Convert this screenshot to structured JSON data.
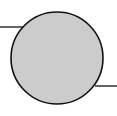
{
  "diagram": {
    "node": {
      "shape": "circle",
      "cx": 57,
      "cy": 58,
      "r": 46,
      "fill": "#cccccc",
      "stroke": "#111111"
    },
    "edges": [
      {
        "id": "left-connector",
        "x1": 0,
        "y1": 27,
        "x2": 24,
        "y2": 27,
        "stroke": "#111111"
      },
      {
        "id": "right-connector",
        "x1": 95,
        "y1": 86,
        "x2": 117,
        "y2": 86,
        "stroke": "#111111"
      }
    ]
  }
}
